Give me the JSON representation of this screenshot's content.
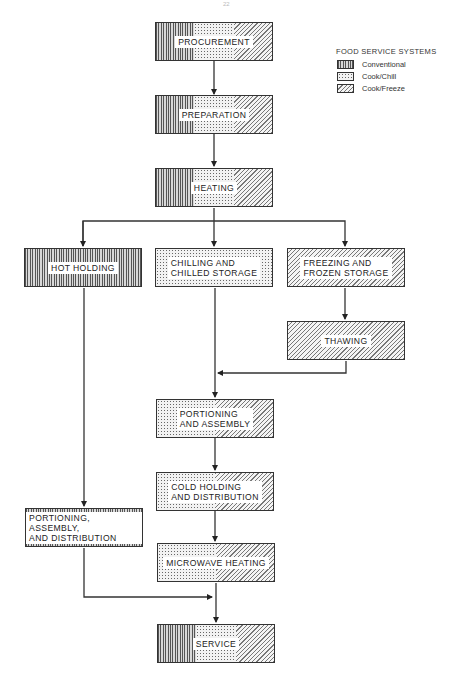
{
  "page_number": "22",
  "legend": {
    "title": "FOOD SERVICE SYSTEMS",
    "items": [
      {
        "label": "Conventional",
        "pattern": "vertical-lines"
      },
      {
        "label": "Cook/Chill",
        "pattern": "dots"
      },
      {
        "label": "Cook/Freeze",
        "pattern": "diagonal-hatch"
      }
    ]
  },
  "nodes": {
    "procurement": {
      "label": "PROCUREMENT",
      "systems": [
        "Conventional",
        "Cook/Chill",
        "Cook/Freeze"
      ]
    },
    "preparation": {
      "label": "PREPARATION",
      "systems": [
        "Conventional",
        "Cook/Chill",
        "Cook/Freeze"
      ]
    },
    "heating": {
      "label": "HEATING",
      "systems": [
        "Conventional",
        "Cook/Chill",
        "Cook/Freeze"
      ]
    },
    "hot_holding": {
      "label": "HOT HOLDING",
      "systems": [
        "Conventional"
      ]
    },
    "chilling": {
      "label": "CHILLING AND\nCHILLED STORAGE",
      "systems": [
        "Cook/Chill"
      ]
    },
    "freezing": {
      "label": "FREEZING AND\nFROZEN STORAGE",
      "systems": [
        "Cook/Freeze"
      ]
    },
    "thawing": {
      "label": "THAWING",
      "systems": [
        "Cook/Freeze"
      ]
    },
    "portioning_assembly": {
      "label": "PORTIONING\nAND ASSEMBLY",
      "systems": [
        "Cook/Chill",
        "Cook/Freeze"
      ]
    },
    "cold_holding": {
      "label": "COLD HOLDING\nAND DISTRIBUTION",
      "systems": [
        "Cook/Chill",
        "Cook/Freeze"
      ]
    },
    "portioning_distribution": {
      "label": "PORTIONING, ASSEMBLY,\nAND DISTRIBUTION",
      "systems": [
        "Conventional"
      ]
    },
    "microwave": {
      "label": "MICROWAVE HEATING",
      "systems": [
        "Cook/Chill",
        "Cook/Freeze"
      ]
    },
    "service": {
      "label": "SERVICE",
      "systems": [
        "Conventional",
        "Cook/Chill",
        "Cook/Freeze"
      ]
    }
  },
  "edges": [
    [
      "procurement",
      "preparation"
    ],
    [
      "preparation",
      "heating"
    ],
    [
      "heating",
      "hot_holding"
    ],
    [
      "heating",
      "chilling"
    ],
    [
      "heating",
      "freezing"
    ],
    [
      "freezing",
      "thawing"
    ],
    [
      "chilling",
      "portioning_assembly"
    ],
    [
      "thawing",
      "portioning_assembly"
    ],
    [
      "portioning_assembly",
      "cold_holding"
    ],
    [
      "cold_holding",
      "microwave"
    ],
    [
      "hot_holding",
      "portioning_distribution"
    ],
    [
      "portioning_distribution",
      "service"
    ],
    [
      "microwave",
      "service"
    ]
  ]
}
